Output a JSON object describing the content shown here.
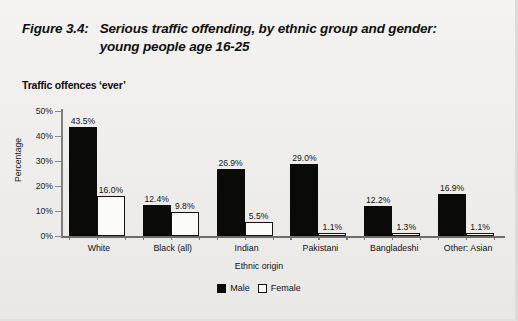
{
  "figure": {
    "number": "Figure 3.4:",
    "title_line1": "Serious traffic offending, by ethnic group and gender:",
    "title_line2": "young people age 16-25",
    "subtitle": "Traffic offences ‘ever’"
  },
  "chart_data": {
    "type": "bar",
    "title": "Serious traffic offending, by ethnic group and gender: young people age 16-25",
    "subtitle": "Traffic offences ‘ever’",
    "xlabel": "Ethnic origin",
    "ylabel": "Percentage",
    "ylim": [
      0,
      50
    ],
    "yticks": [
      0,
      10,
      20,
      30,
      40,
      50
    ],
    "ytick_labels": [
      "0%",
      "10%",
      "20%",
      "30%",
      "40%",
      "50%"
    ],
    "grid": false,
    "legend_position": "bottom-center",
    "categories": [
      "White",
      "Black (all)",
      "Indian",
      "Pakistani",
      "Bangladeshi",
      "Other: Asian"
    ],
    "series": [
      {
        "name": "Male",
        "color": "#0a0a09",
        "values": [
          43.5,
          12.4,
          26.9,
          29.0,
          12.2,
          16.9
        ],
        "data_labels": [
          "43.5%",
          "12.4%",
          "26.9%",
          "29.0%",
          "12.2%",
          "16.9%"
        ]
      },
      {
        "name": "Female",
        "color": "#ffffff",
        "values": [
          16.0,
          9.8,
          5.5,
          1.1,
          1.3,
          1.1
        ],
        "data_labels": [
          "16.0%",
          "9.8%",
          "5.5%",
          "1.1%",
          "1.3%",
          "1.1%"
        ]
      }
    ]
  }
}
